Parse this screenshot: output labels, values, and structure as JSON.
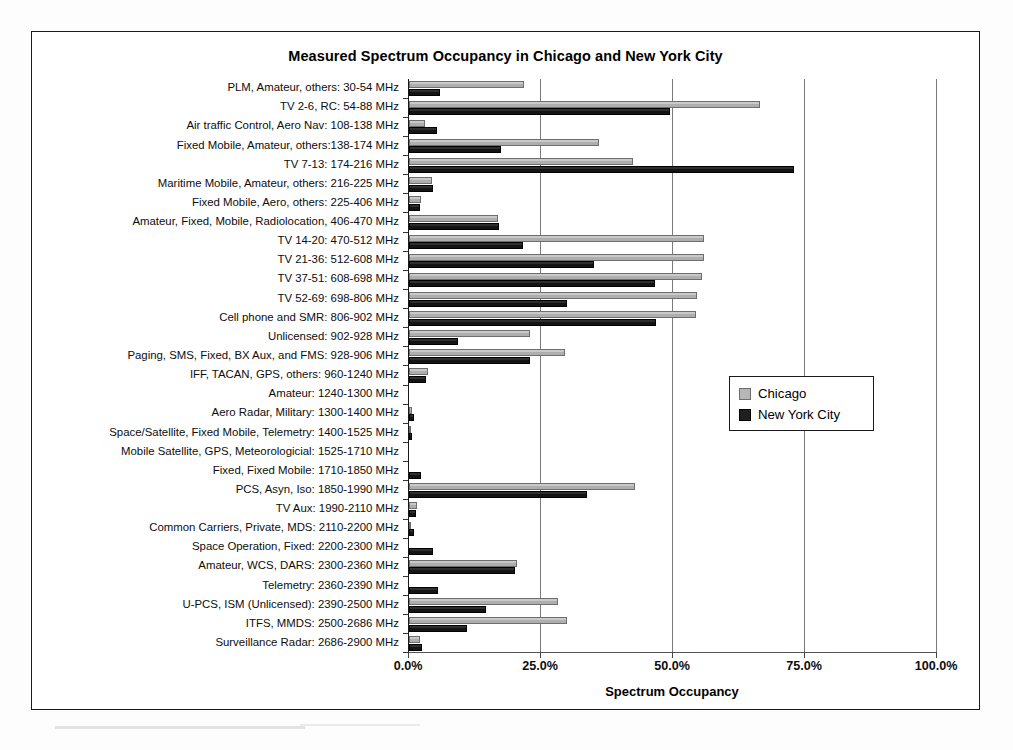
{
  "chart_data": {
    "type": "bar",
    "orientation": "horizontal",
    "title": "Measured Spectrum Occupancy in Chicago and New York City",
    "xlabel": "Spectrum Occupancy",
    "ylabel": "",
    "xlim": [
      0,
      100
    ],
    "xticks": [
      "0.0%",
      "25.0%",
      "50.0%",
      "75.0%",
      "100.0%"
    ],
    "xtick_values": [
      0,
      25,
      50,
      75,
      100
    ],
    "grid": true,
    "legend_position": "right-middle",
    "legend": [
      "Chicago",
      "New York City"
    ],
    "categories": [
      "PLM, Amateur, others: 30-54 MHz",
      "TV 2-6, RC: 54-88 MHz",
      "Air traffic Control, Aero Nav: 108-138 MHz",
      "Fixed Mobile, Amateur, others:138-174 MHz",
      "TV 7-13: 174-216 MHz",
      "Maritime Mobile, Amateur, others: 216-225 MHz",
      "Fixed Mobile, Aero, others: 225-406 MHz",
      "Amateur, Fixed, Mobile, Radiolocation, 406-470 MHz",
      "TV 14-20: 470-512 MHz",
      "TV 21-36: 512-608 MHz",
      "TV 37-51: 608-698 MHz",
      "TV 52-69: 698-806 MHz",
      "Cell phone and SMR: 806-902 MHz",
      "Unlicensed: 902-928 MHz",
      "Paging, SMS, Fixed, BX Aux, and FMS: 928-906 MHz",
      "IFF, TACAN, GPS, others: 960-1240 MHz",
      "Amateur: 1240-1300 MHz",
      "Aero Radar, Military: 1300-1400 MHz",
      "Space/Satellite, Fixed Mobile, Telemetry: 1400-1525 MHz",
      "Mobile Satellite, GPS, Meteorologicial: 1525-1710 MHz",
      "Fixed, Fixed Mobile: 1710-1850 MHz",
      "PCS, Asyn, Iso: 1850-1990 MHz",
      "TV Aux: 1990-2110 MHz",
      "Common Carriers, Private, MDS: 2110-2200 MHz",
      "Space Operation, Fixed: 2200-2300 MHz",
      "Amateur, WCS, DARS: 2300-2360 MHz",
      "Telemetry: 2360-2390 MHz",
      "U-PCS, ISM (Unlicensed): 2390-2500 MHz",
      "ITFS, MMDS: 2500-2686 MHz",
      "Surveillance Radar: 2686-2900 MHz"
    ],
    "series": [
      {
        "name": "Chicago",
        "color": "#b6b6b6",
        "values": [
          21.8,
          66.4,
          3.0,
          36.0,
          42.5,
          4.3,
          2.2,
          16.8,
          55.8,
          55.8,
          55.5,
          54.5,
          54.3,
          23.0,
          29.5,
          3.6,
          0.0,
          0.6,
          0.3,
          0.0,
          0.0,
          42.8,
          1.6,
          0.3,
          0.0,
          20.5,
          0.0,
          28.3,
          30.0,
          2.0
        ]
      },
      {
        "name": "New York City",
        "color": "#1f1f1f",
        "values": [
          5.8,
          49.5,
          5.3,
          17.5,
          73.0,
          4.6,
          2.0,
          17.0,
          21.5,
          35.0,
          46.5,
          30.0,
          46.8,
          9.3,
          23.0,
          3.3,
          0.0,
          1.0,
          0.6,
          0.0,
          2.2,
          33.8,
          1.3,
          1.0,
          4.5,
          20.0,
          5.5,
          14.5,
          11.0,
          2.4
        ]
      }
    ]
  },
  "colors": {
    "chicago": "#b6b6b6",
    "new_york_city": "#1f1f1f",
    "gridline": "#7a7a7a",
    "frame": "#1a1a1a"
  }
}
